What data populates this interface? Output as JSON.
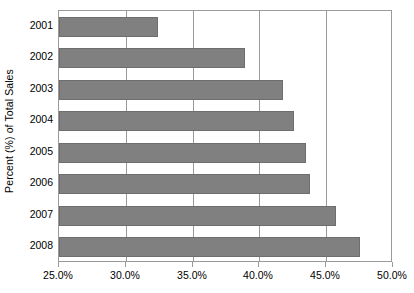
{
  "chart_data": {
    "type": "bar",
    "orientation": "horizontal",
    "title": "",
    "xlabel": "",
    "ylabel": "Percent (%) of Total Sales",
    "categories": [
      "2001",
      "2002",
      "2003",
      "2004",
      "2005",
      "2006",
      "2007",
      "2008"
    ],
    "values": [
      32.4,
      38.9,
      41.8,
      42.6,
      43.5,
      43.8,
      45.7,
      47.5
    ],
    "xlim": [
      25.0,
      50.0
    ],
    "xticks": [
      25.0,
      30.0,
      35.0,
      40.0,
      45.0,
      50.0
    ],
    "xtick_labels": [
      "25.0%",
      "30.0%",
      "35.0%",
      "40.0%",
      "45.0%",
      "50.0%"
    ],
    "grid": true,
    "grid_axis": "x",
    "legend": false,
    "bar_color": "#808080",
    "bar_border_color": "#6e6e6e",
    "axis_color": "#9a9a9a",
    "background": "#ffffff"
  }
}
